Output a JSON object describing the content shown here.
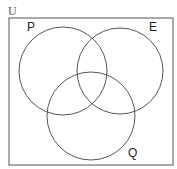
{
  "diagram": {
    "type": "venn",
    "universe_label": "U",
    "sets": [
      {
        "label": "P",
        "cx": 63,
        "cy": 71,
        "r": 44,
        "label_x": 27,
        "label_y": 31
      },
      {
        "label": "E",
        "cx": 120,
        "cy": 71,
        "r": 43,
        "label_x": 149,
        "label_y": 31
      },
      {
        "label": "Q",
        "cx": 91,
        "cy": 116,
        "r": 44,
        "label_x": 128,
        "label_y": 157
      }
    ],
    "colors": {
      "stroke": "#555555",
      "background": "#ffffff"
    }
  }
}
